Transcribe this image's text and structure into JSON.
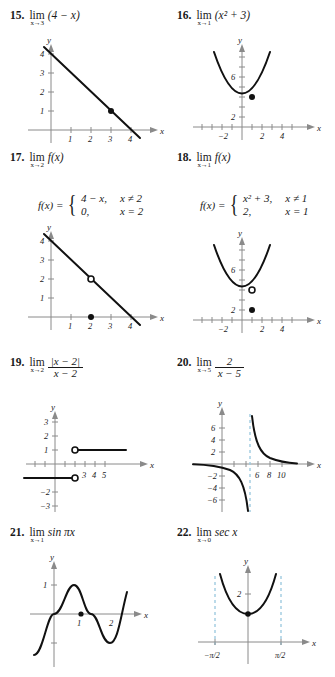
{
  "problems": [
    {
      "number": "15.",
      "lim": "lim",
      "approach": "x→3",
      "expression": "(4 − x)",
      "graph": {
        "xlabel": "x",
        "ylabel": "y",
        "x_ticks": [
          "1",
          "2",
          "3",
          "4"
        ],
        "y_ticks": [
          "1",
          "2",
          "3",
          "4"
        ],
        "curve": "line y = 4 - x",
        "points": [
          {
            "type": "filled",
            "x": 3,
            "y": 1
          }
        ]
      }
    },
    {
      "number": "16.",
      "lim": "lim",
      "approach": "x→1",
      "expression": "(x² + 3)",
      "graph": {
        "xlabel": "x",
        "ylabel": "y",
        "x_ticks": [
          "−2",
          "2",
          "4"
        ],
        "y_ticks": [
          "2",
          "6"
        ],
        "curve": "parabola y = x^2 + 3",
        "points": [
          {
            "type": "filled",
            "x": 1,
            "y": 4
          }
        ]
      }
    },
    {
      "number": "17.",
      "lim": "lim",
      "approach": "x→2",
      "expression": "f(x)",
      "piecewise": {
        "fx": "f(x) =",
        "rows": [
          {
            "value": "4 − x,",
            "condition": "x ≠ 2"
          },
          {
            "value": "0,",
            "condition": "x = 2"
          }
        ]
      },
      "graph": {
        "xlabel": "x",
        "ylabel": "y",
        "x_ticks": [
          "1",
          "2",
          "3",
          "4"
        ],
        "y_ticks": [
          "1",
          "2",
          "3",
          "4"
        ],
        "curve": "line y = 4 - x",
        "points": [
          {
            "type": "open",
            "x": 2,
            "y": 2
          },
          {
            "type": "filled",
            "x": 2,
            "y": 0
          }
        ]
      }
    },
    {
      "number": "18.",
      "lim": "lim",
      "approach": "x→1",
      "expression": "f(x)",
      "piecewise": {
        "fx": "f(x) =",
        "rows": [
          {
            "value": "x² + 3,",
            "condition": "x ≠ 1"
          },
          {
            "value": "2,",
            "condition": "x = 1"
          }
        ]
      },
      "graph": {
        "xlabel": "x",
        "ylabel": "y",
        "x_ticks": [
          "−2",
          "2",
          "4"
        ],
        "y_ticks": [
          "2",
          "6"
        ],
        "curve": "parabola y = x^2 + 3",
        "points": [
          {
            "type": "open",
            "x": 1,
            "y": 4
          },
          {
            "type": "filled",
            "x": 1,
            "y": 2
          }
        ]
      }
    },
    {
      "number": "19.",
      "lim": "lim",
      "approach": "x→2",
      "numerator": "|x − 2|",
      "denominator": "x − 2",
      "graph": {
        "xlabel": "x",
        "ylabel": "y",
        "x_ticks": [
          "3",
          "4",
          "5"
        ],
        "y_ticks": [
          "1",
          "2",
          "3",
          "−2",
          "−3"
        ],
        "curve": "step: y = 1 for x > 2, y = -1 for x < 2",
        "points": [
          {
            "type": "open",
            "x": 2,
            "y": 1
          },
          {
            "type": "open",
            "x": 2,
            "y": -1
          }
        ]
      }
    },
    {
      "number": "20.",
      "lim": "lim",
      "approach": "x→5",
      "numerator": "2",
      "denominator": "x − 5",
      "graph": {
        "xlabel": "x",
        "ylabel": "y",
        "x_ticks": [
          "6",
          "8",
          "10"
        ],
        "y_ticks": [
          "2",
          "4",
          "6",
          "−2",
          "−4",
          "−6"
        ],
        "curve": "hyperbola y = 2/(x-5)",
        "asymptote": "x = 5",
        "asymptote_color": "#9fcbe0",
        "points": []
      }
    },
    {
      "number": "21.",
      "lim": "lim",
      "approach": "x→1",
      "expression": "sin πx",
      "graph": {
        "xlabel": "x",
        "ylabel": "y",
        "x_ticks": [
          "1",
          "2"
        ],
        "y_ticks": [
          "1"
        ],
        "curve": "y = sin(pi x)",
        "points": [
          {
            "type": "filled",
            "x": 1,
            "y": 0
          }
        ]
      }
    },
    {
      "number": "22.",
      "lim": "lim",
      "approach": "x→0",
      "expression": "sec x",
      "graph": {
        "xlabel": "x",
        "ylabel": "y",
        "x_ticks": [
          "−π/2",
          "π/2"
        ],
        "y_ticks": [
          "2"
        ],
        "curve": "y = sec x",
        "asymptote": "x = ±π/2",
        "asymptote_color": "#9fcbe0",
        "points": [
          {
            "type": "filled",
            "x": 0,
            "y": 1
          }
        ]
      }
    }
  ]
}
